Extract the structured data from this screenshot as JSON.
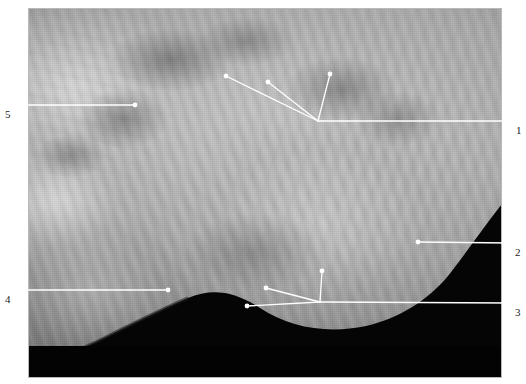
{
  "figure": {
    "width": 526,
    "height": 384,
    "background_color": "#ffffff",
    "kind": "grayscale-anatomical-photograph",
    "plate": {
      "x": 28,
      "y": 8,
      "width": 474,
      "height": 370,
      "border_color": "#b8b8b8"
    }
  },
  "annotation_style": {
    "line_color": "#ffffff",
    "line_width": 1.3,
    "marker_radius": 2.4,
    "marker_fill": "#ffffff",
    "label_color": "#1a1a1a",
    "label_font_size": 11
  },
  "labels": [
    {
      "id": "label-1",
      "text": "1",
      "text_x": 516,
      "text_y": 125,
      "side": "right",
      "stem": {
        "from_x": 512,
        "from_y": 121,
        "to_x": 318,
        "to_y": 121
      },
      "junction": {
        "x": 318,
        "y": 121
      },
      "branches": [
        {
          "dot_x": 226,
          "dot_y": 76
        },
        {
          "dot_x": 268,
          "dot_y": 82
        },
        {
          "dot_x": 330,
          "dot_y": 74
        }
      ]
    },
    {
      "id": "label-2",
      "text": "2",
      "text_x": 515,
      "text_y": 247,
      "side": "right",
      "stem": {
        "from_x": 511,
        "from_y": 243,
        "to_x": 418,
        "to_y": 242
      },
      "junction": null,
      "branches": [
        {
          "dot_x": 418,
          "dot_y": 242
        }
      ]
    },
    {
      "id": "label-3",
      "text": "3",
      "text_x": 515,
      "text_y": 307,
      "side": "right",
      "stem": {
        "from_x": 511,
        "from_y": 303,
        "to_x": 320,
        "to_y": 302
      },
      "junction": {
        "x": 320,
        "y": 302
      },
      "branches": [
        {
          "dot_x": 247,
          "dot_y": 306
        },
        {
          "dot_x": 266,
          "dot_y": 288
        },
        {
          "dot_x": 322,
          "dot_y": 271
        }
      ]
    },
    {
      "id": "label-4",
      "text": "4",
      "text_x": 5,
      "text_y": 294,
      "side": "left",
      "stem": {
        "from_x": 17,
        "from_y": 290,
        "to_x": 168,
        "to_y": 290
      },
      "junction": null,
      "branches": [
        {
          "dot_x": 168,
          "dot_y": 290
        }
      ]
    },
    {
      "id": "label-5",
      "text": "5",
      "text_x": 5,
      "text_y": 109,
      "side": "left",
      "stem": {
        "from_x": 17,
        "from_y": 105,
        "to_x": 135,
        "to_y": 105
      },
      "junction": null,
      "branches": [
        {
          "dot_x": 135,
          "dot_y": 105
        }
      ]
    }
  ]
}
